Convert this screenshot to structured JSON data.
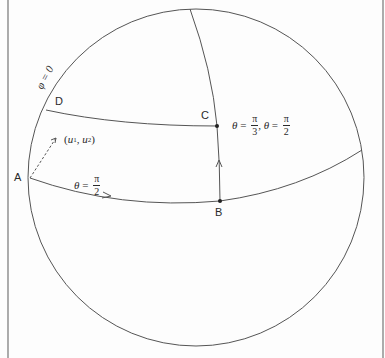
{
  "figure": {
    "type": "spherical coordinate diagram",
    "colors": {
      "stroke": "#555555",
      "text": "#2a2a2a",
      "frame": "#888888",
      "background": "#fdfdfd"
    },
    "points": [
      {
        "id": "A",
        "label": "A"
      },
      {
        "id": "B",
        "label": "B"
      },
      {
        "id": "C",
        "label": "C"
      },
      {
        "id": "D",
        "label": "D"
      }
    ],
    "labels": {
      "phi_zero": "φ = 0",
      "coords": {
        "open": "(",
        "u": "u",
        "sup1": "1",
        "sep": ", ",
        "u2": "u",
        "sup2": "2",
        "close": ")"
      },
      "equator": {
        "theta": "θ",
        "eq": " = ",
        "num": "π",
        "den": "2"
      },
      "point_c_coords": {
        "theta1": "θ",
        "eq1": " = ",
        "num1": "π",
        "den1": "3",
        "sep": ", ",
        "theta2": "θ",
        "eq2": " = ",
        "num2": "π",
        "den2": "2"
      }
    }
  }
}
